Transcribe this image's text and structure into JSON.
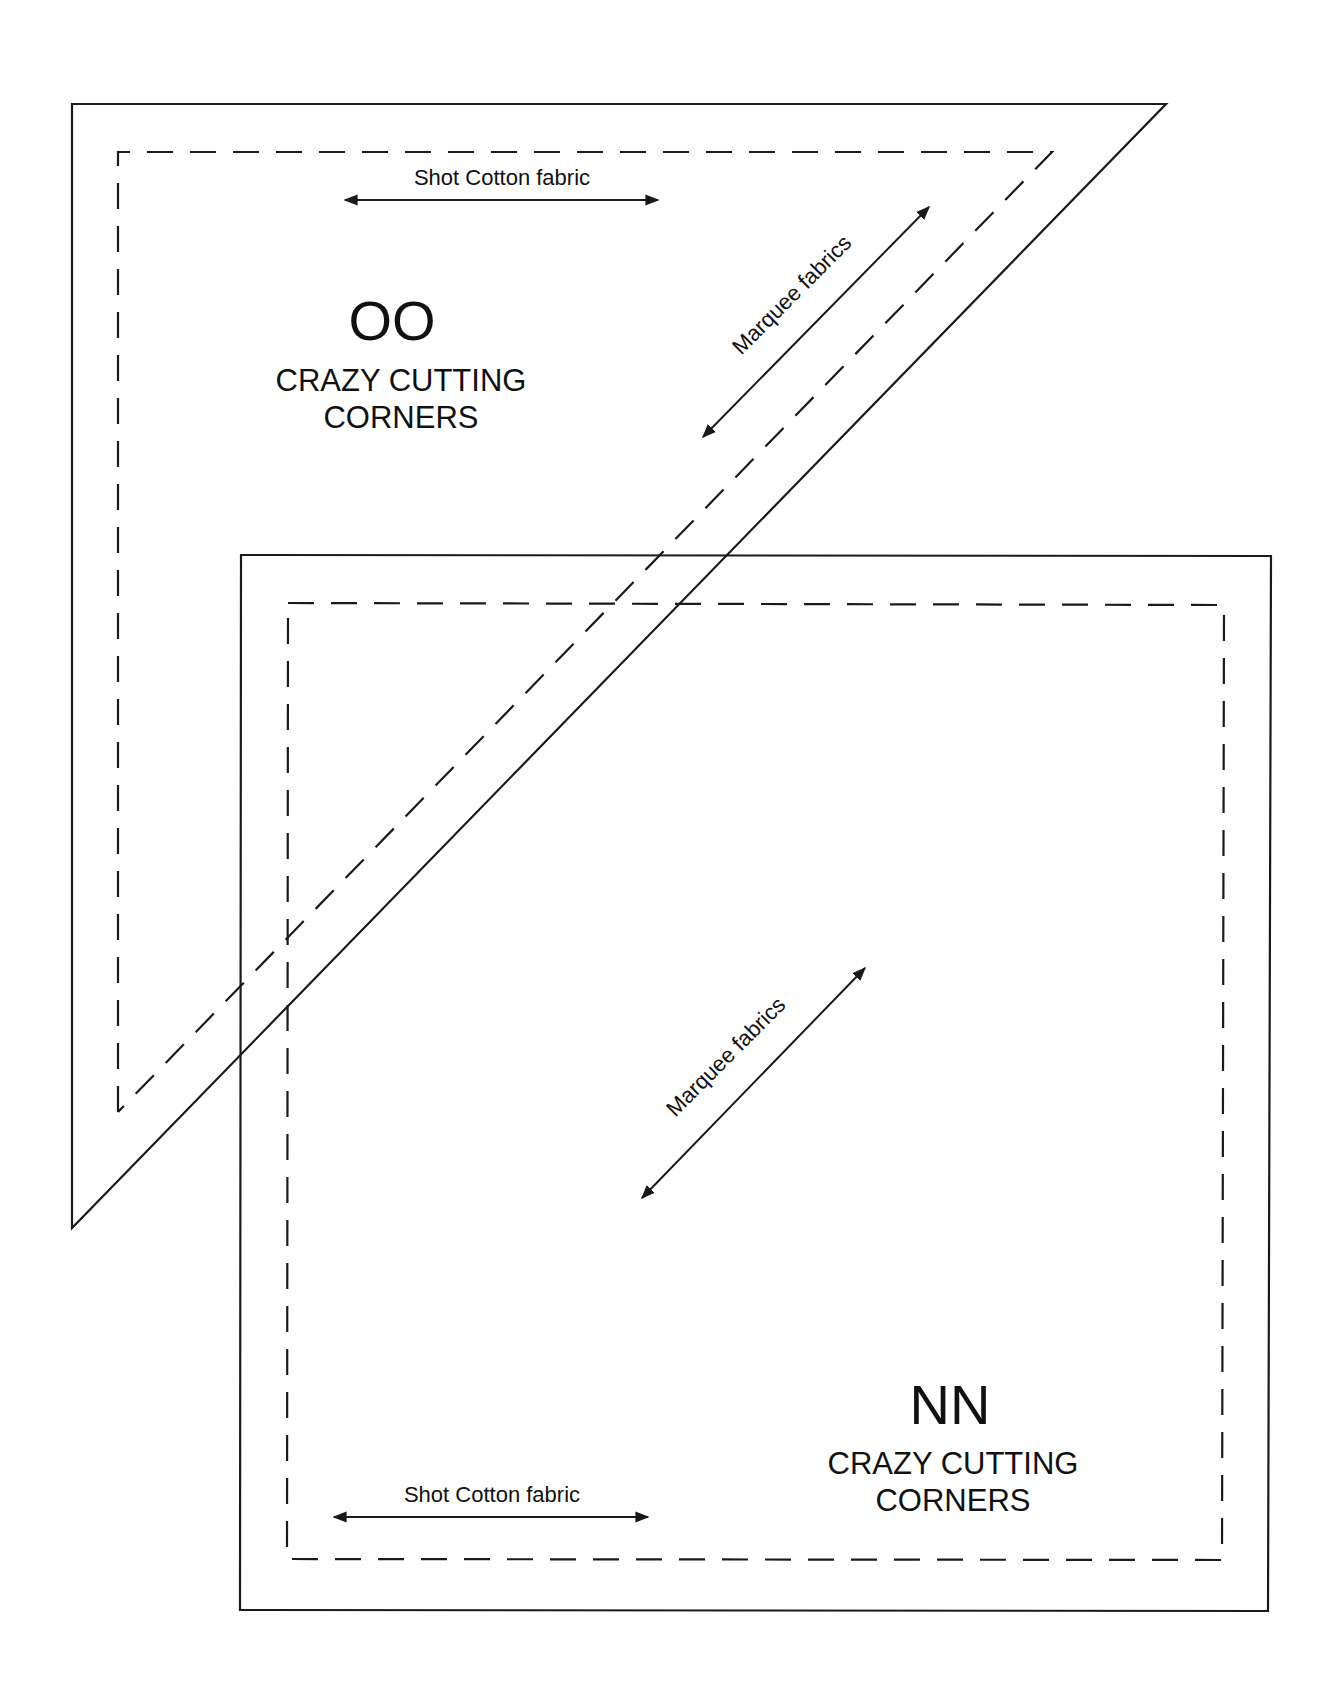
{
  "diagram": {
    "type": "quilt-template-pieces",
    "pieces": [
      {
        "id": "OO",
        "shape": "right-triangle",
        "code": "OO",
        "title_line1": "CRAZY CUTTING",
        "title_line2": "CORNERS",
        "grain_labels": {
          "horizontal": "Shot Cotton fabric",
          "diagonal": "Marquee fabrics"
        }
      },
      {
        "id": "NN",
        "shape": "square",
        "code": "NN",
        "title_line1": "CRAZY CUTTING",
        "title_line2": "CORNERS",
        "grain_labels": {
          "horizontal": "Shot Cotton fabric",
          "diagonal": "Marquee fabrics"
        }
      }
    ],
    "legend": {
      "solid_line": "cutting line",
      "dashed_line": "seam line",
      "arrow": "grain direction"
    },
    "colors": {
      "line": "#1a1a1a",
      "background": "#ffffff"
    }
  }
}
